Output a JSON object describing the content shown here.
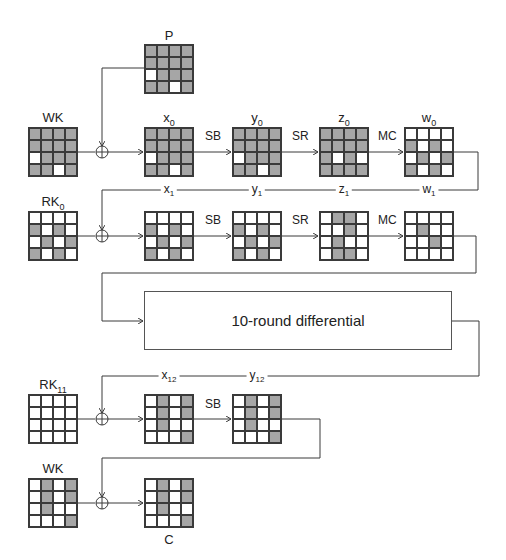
{
  "colors": {
    "active": "#a6a6a6",
    "inactive": "#ffffff",
    "line": "#3a3a3a"
  },
  "states": {
    "P": {
      "label": "P",
      "sub": "",
      "cells": [
        [
          1,
          1,
          1,
          1
        ],
        [
          1,
          1,
          1,
          1
        ],
        [
          0,
          1,
          1,
          1
        ],
        [
          1,
          1,
          0,
          1
        ]
      ]
    },
    "WK_top": {
      "label": "WK",
      "sub": "",
      "cells": [
        [
          1,
          1,
          1,
          1
        ],
        [
          1,
          1,
          1,
          1
        ],
        [
          0,
          1,
          1,
          1
        ],
        [
          1,
          1,
          0,
          1
        ]
      ]
    },
    "x0": {
      "label": "x",
      "sub": "0",
      "cells": [
        [
          1,
          1,
          1,
          1
        ],
        [
          1,
          1,
          1,
          1
        ],
        [
          0,
          1,
          1,
          1
        ],
        [
          1,
          1,
          0,
          1
        ]
      ]
    },
    "y0": {
      "label": "y",
      "sub": "0",
      "cells": [
        [
          1,
          1,
          1,
          1
        ],
        [
          1,
          1,
          1,
          1
        ],
        [
          0,
          1,
          1,
          1
        ],
        [
          1,
          1,
          0,
          1
        ]
      ]
    },
    "z0": {
      "label": "z",
      "sub": "0",
      "cells": [
        [
          1,
          1,
          1,
          1
        ],
        [
          1,
          1,
          1,
          1
        ],
        [
          1,
          0,
          1,
          0
        ],
        [
          1,
          1,
          1,
          1
        ]
      ]
    },
    "w0": {
      "label": "w",
      "sub": "0",
      "cells": [
        [
          0,
          0,
          0,
          0
        ],
        [
          1,
          0,
          1,
          0
        ],
        [
          0,
          1,
          0,
          1
        ],
        [
          1,
          0,
          1,
          0
        ]
      ]
    },
    "RK0": {
      "label": "RK",
      "sub": "0",
      "cells": [
        [
          0,
          0,
          0,
          0
        ],
        [
          1,
          0,
          1,
          0
        ],
        [
          0,
          1,
          0,
          1
        ],
        [
          1,
          0,
          1,
          0
        ]
      ]
    },
    "x1": {
      "label": "x",
      "sub": "1",
      "cells": [
        [
          0,
          0,
          0,
          0
        ],
        [
          1,
          0,
          1,
          0
        ],
        [
          0,
          1,
          0,
          1
        ],
        [
          1,
          0,
          1,
          0
        ]
      ]
    },
    "y1": {
      "label": "y",
      "sub": "1",
      "cells": [
        [
          0,
          0,
          0,
          0
        ],
        [
          1,
          0,
          1,
          0
        ],
        [
          0,
          1,
          0,
          1
        ],
        [
          1,
          0,
          1,
          0
        ]
      ]
    },
    "z1": {
      "label": "z",
      "sub": "1",
      "cells": [
        [
          0,
          1,
          1,
          0
        ],
        [
          0,
          0,
          1,
          0
        ],
        [
          0,
          1,
          0,
          0
        ],
        [
          0,
          1,
          1,
          0
        ]
      ]
    },
    "w1": {
      "label": "w",
      "sub": "1",
      "cells": [
        [
          0,
          0,
          0,
          0
        ],
        [
          0,
          1,
          0,
          0
        ],
        [
          0,
          0,
          1,
          0
        ],
        [
          0,
          0,
          0,
          0
        ]
      ]
    },
    "RK11": {
      "label": "RK",
      "sub": "11",
      "cells": [
        [
          0,
          0,
          0,
          0
        ],
        [
          0,
          0,
          0,
          0
        ],
        [
          0,
          0,
          0,
          0
        ],
        [
          0,
          0,
          0,
          0
        ]
      ]
    },
    "x12": {
      "label": "x",
      "sub": "12",
      "cells": [
        [
          0,
          1,
          0,
          1
        ],
        [
          0,
          1,
          0,
          1
        ],
        [
          0,
          1,
          0,
          0
        ],
        [
          0,
          0,
          0,
          1
        ]
      ]
    },
    "y12": {
      "label": "y",
      "sub": "12",
      "cells": [
        [
          0,
          1,
          0,
          1
        ],
        [
          0,
          1,
          0,
          1
        ],
        [
          0,
          1,
          0,
          0
        ],
        [
          0,
          0,
          0,
          1
        ]
      ]
    },
    "WK_bot": {
      "label": "WK",
      "sub": "",
      "cells": [
        [
          0,
          1,
          0,
          1
        ],
        [
          0,
          1,
          0,
          1
        ],
        [
          0,
          1,
          0,
          0
        ],
        [
          0,
          0,
          0,
          1
        ]
      ]
    },
    "C": {
      "label": "C",
      "sub": "",
      "cells": [
        [
          0,
          1,
          0,
          1
        ],
        [
          0,
          1,
          0,
          1
        ],
        [
          0,
          1,
          0,
          0
        ],
        [
          0,
          0,
          0,
          1
        ]
      ]
    }
  },
  "operations": {
    "sb": "SB",
    "sr": "SR",
    "mc": "MC"
  },
  "diff_box": {
    "label": "10-round differential"
  }
}
